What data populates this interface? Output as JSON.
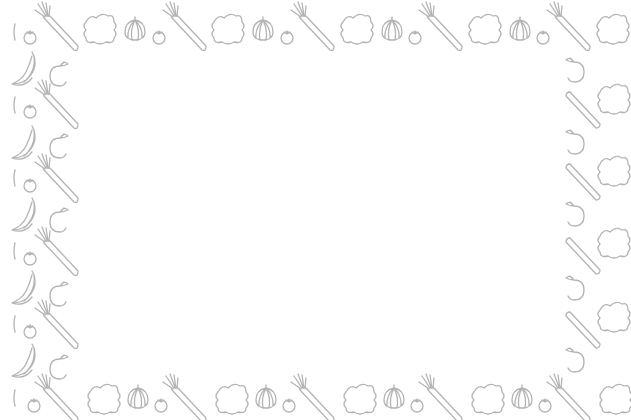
{
  "image": {
    "description": "Decorative frame border of vegetable and fruit line-art icons with blank white center",
    "background_color": "#ffffff",
    "stroke_color": "#b4b4b4"
  },
  "border": {
    "top_pattern": [
      "lettuce-icon",
      "onion-icon",
      "tomato-icon",
      "carrot-icon"
    ],
    "left_pattern": [
      "banana-icon",
      "apple-icon",
      "pepper-icon",
      "tomato-icon",
      "carrot-icon"
    ],
    "right_pattern": [
      "apple-icon",
      "carrot-icon",
      "lettuce-icon"
    ],
    "bottom_pattern": [
      "lettuce-icon",
      "onion-icon",
      "tomato-icon",
      "carrot-icon"
    ]
  },
  "center_panel": {
    "content": ""
  }
}
